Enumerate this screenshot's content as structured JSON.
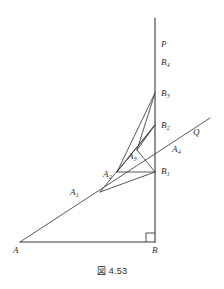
{
  "figure": {
    "caption": "図 4.53",
    "stroke_color": "#3a3a3a",
    "label_color": "#2b2b2b",
    "background": "#ffffff"
  },
  "points": {
    "A": {
      "label": "A",
      "sub": "",
      "x": 20,
      "y": 242
    },
    "B": {
      "label": "B",
      "sub": "",
      "x": 155,
      "y": 242
    },
    "P": {
      "label": "P",
      "sub": "",
      "x": 155,
      "y": 18
    },
    "Q": {
      "label": "Q",
      "sub": "",
      "x": 210,
      "y": 118
    },
    "A1": {
      "label": "A",
      "sub": "1",
      "x": 100,
      "y": 192
    },
    "A2": {
      "label": "A",
      "sub": "2",
      "x": 117,
      "y": 172
    },
    "A3": {
      "label": "A",
      "sub": "3",
      "x": 137,
      "y": 150
    },
    "A4": {
      "label": "A",
      "sub": "4",
      "x": 176,
      "y": 142
    },
    "B1": {
      "label": "B",
      "sub": "1",
      "x": 155,
      "y": 172
    },
    "B2": {
      "label": "B",
      "sub": "2",
      "x": 155,
      "y": 125
    },
    "B3": {
      "label": "B",
      "sub": "3",
      "x": 155,
      "y": 93
    },
    "B4": {
      "label": "B",
      "sub": "4",
      "x": 155,
      "y": 62
    }
  },
  "labels": [
    {
      "name": "point-label-P",
      "text": "P",
      "sub": "",
      "left": 161,
      "top": 40
    },
    {
      "name": "point-label-B4",
      "text": "B",
      "sub": "4",
      "left": 161,
      "top": 58
    },
    {
      "name": "point-label-B3",
      "text": "B",
      "sub": "3",
      "left": 161,
      "top": 89
    },
    {
      "name": "point-label-B2",
      "text": "B",
      "sub": "2",
      "left": 161,
      "top": 121
    },
    {
      "name": "point-label-Q",
      "text": "Q",
      "sub": "",
      "left": 193,
      "top": 128
    },
    {
      "name": "point-label-A4",
      "text": "A",
      "sub": "4",
      "left": 172,
      "top": 145
    },
    {
      "name": "point-label-A3",
      "text": "A",
      "sub": "3",
      "left": 128,
      "top": 152
    },
    {
      "name": "point-label-B1",
      "text": "B",
      "sub": "1",
      "left": 161,
      "top": 167
    },
    {
      "name": "point-label-A2",
      "text": "A",
      "sub": "2",
      "left": 103,
      "top": 170
    },
    {
      "name": "point-label-A1",
      "text": "A",
      "sub": "1",
      "left": 70,
      "top": 188
    },
    {
      "name": "point-label-A",
      "text": "A",
      "sub": "",
      "left": 13,
      "top": 246
    },
    {
      "name": "point-label-B",
      "text": "B",
      "sub": "",
      "left": 152,
      "top": 246
    }
  ],
  "segments": [
    {
      "name": "baseline-AB",
      "x1": 20,
      "y1": 242,
      "x2": 155,
      "y2": 242
    },
    {
      "name": "vertical-BP",
      "x1": 155,
      "y1": 242,
      "x2": 155,
      "y2": 18
    },
    {
      "name": "ray-AQ",
      "x1": 20,
      "y1": 242,
      "x2": 210,
      "y2": 118
    },
    {
      "name": "segment-A1-B1",
      "x1": 100,
      "y1": 192,
      "x2": 155,
      "y2": 172
    },
    {
      "name": "segment-B1-A2",
      "x1": 155,
      "y1": 172,
      "x2": 117,
      "y2": 172
    },
    {
      "name": "segment-A1-B2",
      "x1": 100,
      "y1": 192,
      "x2": 155,
      "y2": 125
    },
    {
      "name": "segment-A2-B2",
      "x1": 117,
      "y1": 172,
      "x2": 155,
      "y2": 125
    },
    {
      "name": "segment-A2-B3",
      "x1": 117,
      "y1": 172,
      "x2": 155,
      "y2": 93
    },
    {
      "name": "segment-A3-B3",
      "x1": 137,
      "y1": 150,
      "x2": 155,
      "y2": 93
    },
    {
      "name": "segment-A3-B2",
      "x1": 137,
      "y1": 150,
      "x2": 155,
      "y2": 125
    },
    {
      "name": "segment-A3-B1",
      "x1": 137,
      "y1": 150,
      "x2": 155,
      "y2": 172
    }
  ],
  "right_angle": {
    "name": "right-angle-mark-B",
    "x": 155,
    "y": 242,
    "size": 9
  }
}
